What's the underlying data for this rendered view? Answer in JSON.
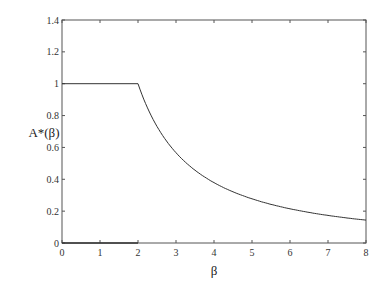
{
  "chart_data": {
    "type": "line",
    "title": "",
    "xlabel": "β",
    "ylabel": "A*(β)",
    "xlim": [
      0,
      8
    ],
    "ylim": [
      0,
      1.4
    ],
    "x_ticks": [
      0,
      1,
      2,
      3,
      4,
      5,
      6,
      7,
      8
    ],
    "y_ticks": [
      0,
      0.2,
      0.4,
      0.6,
      0.8,
      1,
      1.2,
      1.4
    ],
    "x_tick_labels": [
      "0",
      "1",
      "2",
      "3",
      "4",
      "5",
      "6",
      "7",
      "8"
    ],
    "y_tick_labels": [
      "0",
      "0.2",
      "0.4",
      "0.6",
      "0.8",
      "1",
      "1.2",
      "1.4"
    ],
    "grid": false,
    "legend": null,
    "series": [
      {
        "name": "A*(β)",
        "x": [
          0,
          0.5,
          1,
          1.5,
          2,
          2.25,
          2.5,
          2.75,
          3,
          3.5,
          4,
          4.5,
          5,
          5.5,
          6,
          6.5,
          7,
          7.5,
          8
        ],
        "values": [
          1,
          1,
          1,
          1,
          1,
          0.85,
          0.73,
          0.64,
          0.57,
          0.46,
          0.38,
          0.32,
          0.28,
          0.24,
          0.21,
          0.19,
          0.17,
          0.16,
          0.145
        ]
      },
      {
        "name": "baseline",
        "x": [
          0,
          2
        ],
        "values": [
          0,
          0
        ]
      }
    ]
  }
}
